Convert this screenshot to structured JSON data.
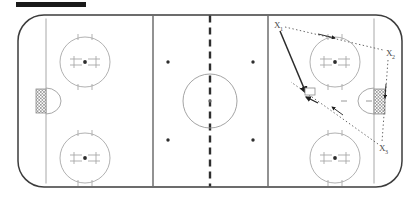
{
  "diagram": {
    "type": "ice-hockey-rink-play-diagram",
    "top_bar_label": "",
    "colors": {
      "rink_outline": "#3c3c3c",
      "ice": "#ffffff",
      "blue_line": "#6e6e6e",
      "center_line": "#3c3c3c",
      "faceoff_mark": "#9a9a9a",
      "goal_net": "#8c8c8c",
      "play_line": "#2b2b2b",
      "player_label": "#4a4a4a"
    }
  },
  "rink": {
    "left_zone": {
      "goal_line_label": "goal-line-left",
      "faceoff_circles": [
        "upper-left-faceoff-circle",
        "lower-left-faceoff-circle"
      ],
      "goal_crease": "left-goal-crease",
      "goal_net": "left-goal-net"
    },
    "neutral_zone": {
      "center_line_label": "center-line",
      "center_circle_label": "center-faceoff-circle",
      "dots": [
        "neutral-dot-upper-left",
        "neutral-dot-upper-right",
        "neutral-dot-lower-left",
        "neutral-dot-lower-right"
      ]
    },
    "right_zone": {
      "goal_line_label": "goal-line-right",
      "faceoff_circles": [
        "upper-right-faceoff-circle",
        "lower-right-faceoff-circle"
      ],
      "goal_crease": "right-goal-crease",
      "goal_net": "right-goal-net"
    },
    "blue_lines": [
      "blue-line-left",
      "blue-line-right"
    ]
  },
  "players": [
    {
      "id": "x1",
      "label": "X",
      "subscript": "1",
      "x": 276,
      "y": 24
    },
    {
      "id": "x2",
      "label": "X",
      "subscript": "2",
      "x": 390,
      "y": 53
    },
    {
      "id": "x3",
      "label": "X",
      "subscript": "3",
      "x": 383,
      "y": 148
    }
  ],
  "play_paths": [
    {
      "id": "shot-path",
      "style": "solid",
      "from": "x1",
      "to": "right-goal-crease",
      "has_arrowhead": true
    },
    {
      "id": "pass-path-x1-x2",
      "style": "dotted",
      "from": "x1",
      "to": "x2",
      "has_arrowhead": true
    },
    {
      "id": "skate-path-x2-x3",
      "style": "dotted",
      "from": "x2",
      "to": "x3",
      "has_arrowhead": true
    },
    {
      "id": "skate-path-x3-net",
      "style": "dotted",
      "from": "x3",
      "to": "right-goal-crease",
      "has_arrowhead": true
    }
  ]
}
